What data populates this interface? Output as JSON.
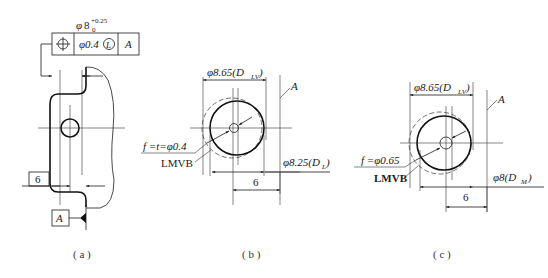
{
  "panel_a": {
    "caption": "( a )",
    "tolerance_dim": {
      "symbol": "φ",
      "nominal": "8",
      "upper_dev": "+0.25",
      "lower_dev": "0"
    },
    "feature_control_frame": {
      "characteristic_icon": "position-icon",
      "tolerance": "φ0.4",
      "modifier": "L",
      "datum": "A"
    },
    "datum_label": "A",
    "dimension": "6"
  },
  "panel_b": {
    "caption": "( b )",
    "top_dim": "φ8.65(D",
    "top_dim_sub": "LV",
    "datum_label": "A",
    "tolerance_label": "f =t=φ0.4",
    "boundary_label": "LMVB",
    "right_dim": "φ8.25(D",
    "right_dim_sub": "L",
    "bottom_dim": "6"
  },
  "panel_c": {
    "caption": "( c )",
    "top_dim": "φ8.65(D",
    "top_dim_sub": "LV",
    "datum_label": "A",
    "tolerance_label": "f =φ0.65",
    "boundary_label": "LMVB",
    "right_dim": "φ8(D",
    "right_dim_sub": "M",
    "bottom_dim": "6"
  }
}
